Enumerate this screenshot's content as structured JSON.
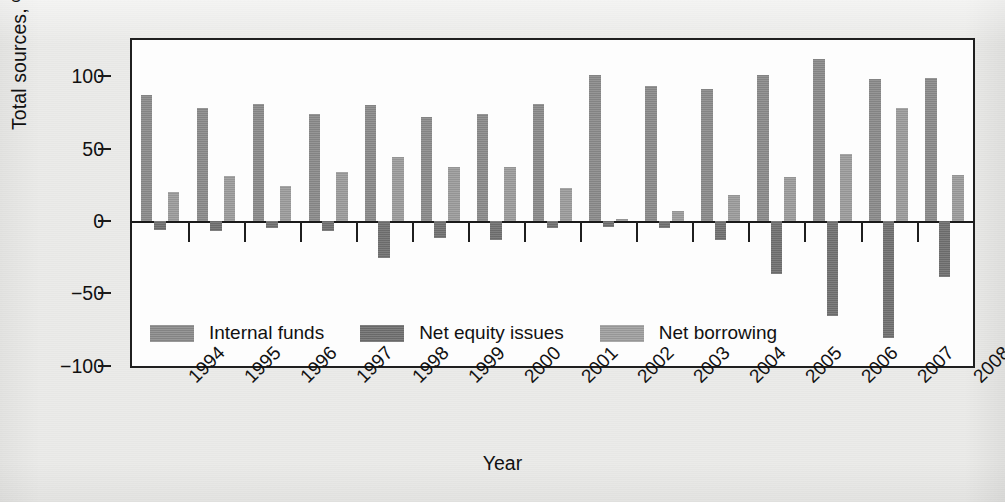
{
  "chart_data": {
    "type": "bar",
    "title": "",
    "xlabel": "Year",
    "ylabel": "Total sources, %",
    "ylim": [
      -100,
      125
    ],
    "yticks": [
      100,
      50,
      0,
      -50,
      -100
    ],
    "ytick_labels": [
      "100",
      "50",
      "0",
      "−50",
      "−100"
    ],
    "grid": false,
    "legend_position": "inside-lower-left",
    "categories": [
      "1994",
      "1995",
      "1996",
      "1997",
      "1998",
      "1999",
      "2000",
      "2001",
      "2002",
      "2003",
      "2004",
      "2005",
      "2006",
      "2007",
      "2008"
    ],
    "series": [
      {
        "name": "Internal funds",
        "color": "#8a8a8a",
        "values": [
          87,
          78,
          81,
          74,
          80,
          72,
          74,
          81,
          101,
          93,
          91,
          101,
          112,
          98,
          99
        ]
      },
      {
        "name": "Net equity issues",
        "color": "#6e6e6e",
        "values": [
          -6,
          -7,
          -5,
          -7,
          -26,
          -12,
          -13,
          -5,
          -4,
          -5,
          -13,
          -37,
          -66,
          -81,
          -39
        ]
      },
      {
        "name": "Net borrowing",
        "color": "#9e9e9e",
        "values": [
          20,
          31,
          24,
          34,
          44,
          37,
          37,
          23,
          1,
          7,
          18,
          30,
          46,
          78,
          32
        ]
      }
    ]
  },
  "axis": {
    "y_title": "Total sources, %",
    "x_title": "Year"
  },
  "legend": {
    "items": [
      {
        "label": "Internal funds"
      },
      {
        "label": "Net equity issues"
      },
      {
        "label": "Net borrowing"
      }
    ]
  },
  "icons": {
    "swatch": "legend-swatch-icon"
  }
}
